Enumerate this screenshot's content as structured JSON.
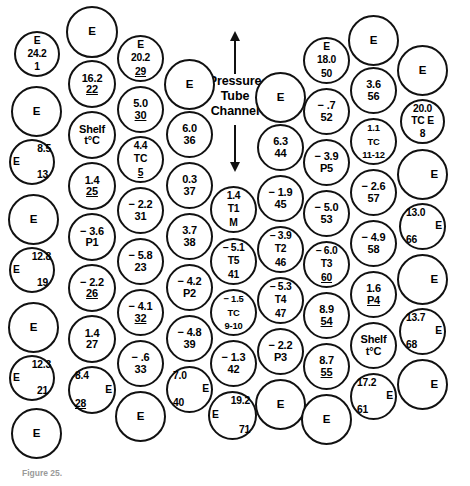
{
  "figure": {
    "center_annotation": [
      "Pressure",
      "Tube",
      "Channel"
    ],
    "caption_label": "Figure 25.",
    "caption_text": "",
    "arrow_up": "arrow-up",
    "arrow_down": "arrow-down"
  },
  "legend_terms": {
    "shelf": "Shelf",
    "shelf_unit": "t°C",
    "empty_marker": "E",
    "thermocouple": "TC"
  },
  "nodes": [
    {
      "id": "c1-r1",
      "col": 1,
      "row": 1,
      "x": 14,
      "y": 31,
      "d": 46,
      "kind": "labeled",
      "lines": [
        {
          "t": "E"
        },
        {
          "t": "24.2"
        },
        {
          "t": "1"
        }
      ],
      "style": "three"
    },
    {
      "id": "c1-r2",
      "col": 1,
      "row": 2,
      "x": 11,
      "y": 86,
      "d": 51,
      "kind": "empty",
      "lines": [
        {
          "t": "E"
        }
      ]
    },
    {
      "id": "c1-r3",
      "col": 1,
      "row": 3,
      "x": 9,
      "y": 139,
      "d": 46,
      "kind": "labeled",
      "lines": [
        {
          "t": "8.5",
          "off": "right"
        },
        {
          "t": "E",
          "off": "left"
        },
        {
          "t": "13",
          "off": "right-in"
        }
      ],
      "style": "three"
    },
    {
      "id": "c1-r4",
      "col": 1,
      "row": 4,
      "x": 8,
      "y": 194,
      "d": 51,
      "kind": "empty",
      "lines": [
        {
          "t": "E"
        }
      ]
    },
    {
      "id": "c1-r5",
      "col": 1,
      "row": 5,
      "x": 9,
      "y": 247,
      "d": 46,
      "kind": "labeled",
      "lines": [
        {
          "t": "12.8",
          "off": "right"
        },
        {
          "t": "E",
          "off": "left"
        },
        {
          "t": "19",
          "off": "right-in"
        }
      ],
      "style": "three"
    },
    {
      "id": "c1-r6",
      "col": 1,
      "row": 6,
      "x": 8,
      "y": 302,
      "d": 51,
      "kind": "empty",
      "lines": [
        {
          "t": "E"
        }
      ]
    },
    {
      "id": "c1-r7",
      "col": 1,
      "row": 7,
      "x": 9,
      "y": 355,
      "d": 46,
      "kind": "labeled",
      "lines": [
        {
          "t": "12.3",
          "off": "right"
        },
        {
          "t": "E",
          "off": "left"
        },
        {
          "t": "21",
          "off": "right-in"
        }
      ],
      "style": "three"
    },
    {
      "id": "c1-r8",
      "col": 1,
      "row": 8,
      "x": 11,
      "y": 408,
      "d": 51,
      "kind": "empty",
      "lines": [
        {
          "t": "E"
        }
      ]
    },
    {
      "id": "c2-r1",
      "col": 2,
      "row": 1,
      "x": 66,
      "y": 6,
      "d": 52,
      "kind": "empty",
      "lines": [
        {
          "t": "E"
        }
      ]
    },
    {
      "id": "c2-r2",
      "col": 2,
      "row": 2,
      "x": 68,
      "y": 60,
      "d": 48,
      "kind": "labeled",
      "lines": [
        {
          "t": "16.2"
        },
        {
          "t": "22",
          "ul": true
        }
      ],
      "style": "labeled"
    },
    {
      "id": "c2-r3",
      "col": 2,
      "row": 3,
      "x": 68,
      "y": 111,
      "d": 48,
      "kind": "labeled",
      "lines": [
        {
          "t": "Shelf"
        },
        {
          "t": "t°C"
        }
      ],
      "style": "labeled"
    },
    {
      "id": "c2-r4",
      "col": 2,
      "row": 4,
      "x": 68,
      "y": 162,
      "d": 48,
      "kind": "labeled",
      "lines": [
        {
          "t": "1.4"
        },
        {
          "t": "25",
          "ul": true
        }
      ],
      "style": "labeled"
    },
    {
      "id": "c2-r5",
      "col": 2,
      "row": 5,
      "x": 68,
      "y": 213,
      "d": 48,
      "kind": "labeled",
      "lines": [
        {
          "t": "− 3.6"
        },
        {
          "t": "P1"
        }
      ],
      "style": "labeled"
    },
    {
      "id": "c2-r6",
      "col": 2,
      "row": 6,
      "x": 68,
      "y": 264,
      "d": 48,
      "kind": "labeled",
      "lines": [
        {
          "t": "− 2.2"
        },
        {
          "t": "26",
          "ul": true
        }
      ],
      "style": "labeled"
    },
    {
      "id": "c2-r7",
      "col": 2,
      "row": 7,
      "x": 68,
      "y": 315,
      "d": 48,
      "kind": "labeled",
      "lines": [
        {
          "t": "1.4"
        },
        {
          "t": "27"
        }
      ],
      "style": "labeled"
    },
    {
      "id": "c2-r8",
      "col": 2,
      "row": 8,
      "x": 68,
      "y": 366,
      "d": 48,
      "kind": "labeled",
      "lines": [
        {
          "t": "8.4",
          "off": "left-in"
        },
        {
          "t": "E",
          "off": "right"
        },
        {
          "t": "28",
          "ul": true,
          "off": "left-in"
        }
      ],
      "style": "three"
    },
    {
      "id": "c3-r1",
      "col": 3,
      "row": 1,
      "x": 117,
      "y": 35,
      "d": 47,
      "kind": "labeled",
      "lines": [
        {
          "t": "E"
        },
        {
          "t": "20.2"
        },
        {
          "t": "29",
          "ul": true
        }
      ],
      "style": "three"
    },
    {
      "id": "c3-r2",
      "col": 3,
      "row": 2,
      "x": 117,
      "y": 86,
      "d": 47,
      "kind": "labeled",
      "lines": [
        {
          "t": "5.0"
        },
        {
          "t": "30",
          "ul": true
        }
      ],
      "style": "labeled"
    },
    {
      "id": "c3-r3",
      "col": 3,
      "row": 3,
      "x": 117,
      "y": 136,
      "d": 47,
      "kind": "labeled",
      "lines": [
        {
          "t": "4.4"
        },
        {
          "t": "TC"
        },
        {
          "t": "5",
          "ul": true
        }
      ],
      "style": "three"
    },
    {
      "id": "c3-r4",
      "col": 3,
      "row": 4,
      "x": 117,
      "y": 187,
      "d": 47,
      "kind": "labeled",
      "lines": [
        {
          "t": "− 2.2"
        },
        {
          "t": "31"
        }
      ],
      "style": "labeled"
    },
    {
      "id": "c3-r5",
      "col": 3,
      "row": 5,
      "x": 117,
      "y": 238,
      "d": 47,
      "kind": "labeled",
      "lines": [
        {
          "t": "− 5.8"
        },
        {
          "t": "23"
        }
      ],
      "style": "labeled"
    },
    {
      "id": "c3-r6",
      "col": 3,
      "row": 6,
      "x": 117,
      "y": 289,
      "d": 47,
      "kind": "labeled",
      "lines": [
        {
          "t": "− 4.1"
        },
        {
          "t": "32",
          "ul": true
        }
      ],
      "style": "labeled"
    },
    {
      "id": "c3-r7",
      "col": 3,
      "row": 7,
      "x": 117,
      "y": 340,
      "d": 47,
      "kind": "labeled",
      "lines": [
        {
          "t": "− .6"
        },
        {
          "t": "33"
        }
      ],
      "style": "labeled"
    },
    {
      "id": "c3-r8",
      "col": 3,
      "row": 8,
      "x": 115,
      "y": 391,
      "d": 51,
      "kind": "empty",
      "lines": [
        {
          "t": "E"
        }
      ]
    },
    {
      "id": "c4-r1",
      "col": 4,
      "row": 1,
      "x": 164,
      "y": 59,
      "d": 51,
      "kind": "empty",
      "lines": [
        {
          "t": "E"
        }
      ]
    },
    {
      "id": "c4-r2",
      "col": 4,
      "row": 2,
      "x": 166,
      "y": 111,
      "d": 47,
      "kind": "labeled",
      "lines": [
        {
          "t": "6.0"
        },
        {
          "t": "36"
        }
      ],
      "style": "labeled"
    },
    {
      "id": "c4-r3",
      "col": 4,
      "row": 3,
      "x": 166,
      "y": 162,
      "d": 47,
      "kind": "labeled",
      "lines": [
        {
          "t": "0.3"
        },
        {
          "t": "37"
        }
      ],
      "style": "labeled"
    },
    {
      "id": "c4-r4",
      "col": 4,
      "row": 4,
      "x": 166,
      "y": 213,
      "d": 47,
      "kind": "labeled",
      "lines": [
        {
          "t": "3.7"
        },
        {
          "t": "38"
        }
      ],
      "style": "labeled"
    },
    {
      "id": "c4-r5",
      "col": 4,
      "row": 5,
      "x": 166,
      "y": 264,
      "d": 47,
      "kind": "labeled",
      "lines": [
        {
          "t": "− 4.2"
        },
        {
          "t": "P2"
        }
      ],
      "style": "labeled"
    },
    {
      "id": "c4-r6",
      "col": 4,
      "row": 6,
      "x": 166,
      "y": 315,
      "d": 47,
      "kind": "labeled",
      "lines": [
        {
          "t": "− 4.8"
        },
        {
          "t": "39"
        }
      ],
      "style": "labeled"
    },
    {
      "id": "c4-r7",
      "col": 4,
      "row": 7,
      "x": 166,
      "y": 366,
      "d": 47,
      "kind": "labeled",
      "lines": [
        {
          "t": "7.0",
          "off": "left-in"
        },
        {
          "t": "E",
          "off": "right"
        },
        {
          "t": "40",
          "off": "left-in"
        }
      ],
      "style": "three"
    },
    {
      "id": "c5-r1",
      "col": 5,
      "row": 1,
      "x": 210,
      "y": 186,
      "d": 47,
      "kind": "labeled",
      "lines": [
        {
          "t": "1.4"
        },
        {
          "t": "T1"
        },
        {
          "t": "M"
        }
      ],
      "style": "three"
    },
    {
      "id": "c5-r2",
      "col": 5,
      "row": 2,
      "x": 210,
      "y": 238,
      "d": 47,
      "kind": "labeled",
      "lines": [
        {
          "t": "− 5.1"
        },
        {
          "t": "T5"
        },
        {
          "t": "41"
        }
      ],
      "style": "three"
    },
    {
      "id": "c5-r3",
      "col": 5,
      "row": 3,
      "x": 210,
      "y": 289,
      "d": 47,
      "kind": "labeled",
      "lines": [
        {
          "t": "− 1.5"
        },
        {
          "t": "TC"
        },
        {
          "t": "9-10"
        }
      ],
      "style": "tiny"
    },
    {
      "id": "c5-r4",
      "col": 5,
      "row": 4,
      "x": 210,
      "y": 340,
      "d": 47,
      "kind": "labeled",
      "lines": [
        {
          "t": "− 1.3"
        },
        {
          "t": "42"
        }
      ],
      "style": "labeled"
    },
    {
      "id": "c5-r5",
      "col": 5,
      "row": 5,
      "x": 208,
      "y": 391,
      "d": 49,
      "kind": "labeled",
      "lines": [
        {
          "t": "19.2",
          "off": "right-in"
        },
        {
          "t": "E",
          "off": "left"
        },
        {
          "t": "71",
          "off": "right-in"
        }
      ],
      "style": "three"
    },
    {
      "id": "c6-r1",
      "col": 6,
      "row": 1,
      "x": 255,
      "y": 72,
      "d": 51,
      "kind": "empty",
      "lines": [
        {
          "t": "E"
        }
      ]
    },
    {
      "id": "c6-r2",
      "col": 6,
      "row": 2,
      "x": 257,
      "y": 124,
      "d": 47,
      "kind": "labeled",
      "lines": [
        {
          "t": "6.3"
        },
        {
          "t": "44"
        }
      ],
      "style": "labeled"
    },
    {
      "id": "c6-r3",
      "col": 6,
      "row": 3,
      "x": 257,
      "y": 175,
      "d": 47,
      "kind": "labeled",
      "lines": [
        {
          "t": "− 1.9"
        },
        {
          "t": "45"
        }
      ],
      "style": "labeled"
    },
    {
      "id": "c6-r4",
      "col": 6,
      "row": 4,
      "x": 257,
      "y": 226,
      "d": 47,
      "kind": "labeled",
      "lines": [
        {
          "t": "− 3.9"
        },
        {
          "t": "T2"
        },
        {
          "t": "46"
        }
      ],
      "style": "three"
    },
    {
      "id": "c6-r5",
      "col": 6,
      "row": 5,
      "x": 257,
      "y": 277,
      "d": 47,
      "kind": "labeled",
      "lines": [
        {
          "t": "− 5.3"
        },
        {
          "t": "T4"
        },
        {
          "t": "47"
        }
      ],
      "style": "three"
    },
    {
      "id": "c6-r6",
      "col": 6,
      "row": 6,
      "x": 257,
      "y": 328,
      "d": 47,
      "kind": "labeled",
      "lines": [
        {
          "t": "− 2.2"
        },
        {
          "t": "P3"
        }
      ],
      "style": "labeled"
    },
    {
      "id": "c6-r7",
      "col": 6,
      "row": 7,
      "x": 255,
      "y": 379,
      "d": 51,
      "kind": "empty",
      "lines": [
        {
          "t": "E"
        }
      ]
    },
    {
      "id": "c7-r1",
      "col": 7,
      "row": 1,
      "x": 303,
      "y": 37,
      "d": 47,
      "kind": "labeled",
      "lines": [
        {
          "t": "E"
        },
        {
          "t": "18.0"
        },
        {
          "t": "50"
        }
      ],
      "style": "three"
    },
    {
      "id": "c7-r2",
      "col": 7,
      "row": 2,
      "x": 303,
      "y": 88,
      "d": 47,
      "kind": "labeled",
      "lines": [
        {
          "t": "− .7"
        },
        {
          "t": "52"
        }
      ],
      "style": "labeled"
    },
    {
      "id": "c7-r3",
      "col": 7,
      "row": 3,
      "x": 303,
      "y": 139,
      "d": 47,
      "kind": "labeled",
      "lines": [
        {
          "t": "− 3.9"
        },
        {
          "t": "P5"
        }
      ],
      "style": "labeled"
    },
    {
      "id": "c7-r4",
      "col": 7,
      "row": 4,
      "x": 303,
      "y": 190,
      "d": 47,
      "kind": "labeled",
      "lines": [
        {
          "t": "− 5.0"
        },
        {
          "t": "53"
        }
      ],
      "style": "labeled"
    },
    {
      "id": "c7-r5",
      "col": 7,
      "row": 5,
      "x": 303,
      "y": 241,
      "d": 47,
      "kind": "labeled",
      "lines": [
        {
          "t": "− 6.0"
        },
        {
          "t": "T3"
        },
        {
          "t": "60",
          "ul": true
        }
      ],
      "style": "three"
    },
    {
      "id": "c7-r6",
      "col": 7,
      "row": 6,
      "x": 303,
      "y": 292,
      "d": 47,
      "kind": "labeled",
      "lines": [
        {
          "t": "8.9"
        },
        {
          "t": "54",
          "ul": true
        }
      ],
      "style": "labeled"
    },
    {
      "id": "c7-r7",
      "col": 7,
      "row": 7,
      "x": 303,
      "y": 343,
      "d": 47,
      "kind": "labeled",
      "lines": [
        {
          "t": "8.7"
        },
        {
          "t": "55",
          "ul": true
        }
      ],
      "style": "labeled"
    },
    {
      "id": "c7-r8",
      "col": 7,
      "row": 8,
      "x": 301,
      "y": 394,
      "d": 51,
      "kind": "empty",
      "lines": [
        {
          "t": "E"
        }
      ]
    },
    {
      "id": "c8-r1",
      "col": 8,
      "row": 1,
      "x": 348,
      "y": 15,
      "d": 51,
      "kind": "empty",
      "lines": [
        {
          "t": "E"
        }
      ]
    },
    {
      "id": "c8-r2",
      "col": 8,
      "row": 2,
      "x": 350,
      "y": 67,
      "d": 47,
      "kind": "labeled",
      "lines": [
        {
          "t": "3.6"
        },
        {
          "t": "56"
        }
      ],
      "style": "labeled"
    },
    {
      "id": "c8-r3",
      "col": 8,
      "row": 3,
      "x": 350,
      "y": 118,
      "d": 47,
      "kind": "labeled",
      "lines": [
        {
          "t": "1.1"
        },
        {
          "t": "TC"
        },
        {
          "t": "11-12"
        }
      ],
      "style": "tiny"
    },
    {
      "id": "c8-r4",
      "col": 8,
      "row": 4,
      "x": 350,
      "y": 169,
      "d": 47,
      "kind": "labeled",
      "lines": [
        {
          "t": "− 2.6"
        },
        {
          "t": "57"
        }
      ],
      "style": "labeled"
    },
    {
      "id": "c8-r5",
      "col": 8,
      "row": 5,
      "x": 350,
      "y": 220,
      "d": 47,
      "kind": "labeled",
      "lines": [
        {
          "t": "− 4.9"
        },
        {
          "t": "58"
        }
      ],
      "style": "labeled"
    },
    {
      "id": "c8-r6",
      "col": 8,
      "row": 6,
      "x": 350,
      "y": 271,
      "d": 47,
      "kind": "labeled",
      "lines": [
        {
          "t": "1.6"
        },
        {
          "t": "P4",
          "ul": true
        }
      ],
      "style": "labeled"
    },
    {
      "id": "c8-r7",
      "col": 8,
      "row": 7,
      "x": 350,
      "y": 322,
      "d": 47,
      "kind": "labeled",
      "lines": [
        {
          "t": "Shelf"
        },
        {
          "t": "t°C"
        }
      ],
      "style": "labeled"
    },
    {
      "id": "c8-r8",
      "col": 8,
      "row": 8,
      "x": 350,
      "y": 373,
      "d": 47,
      "kind": "labeled",
      "lines": [
        {
          "t": "17.2",
          "off": "left-in"
        },
        {
          "t": "E",
          "off": "right"
        },
        {
          "t": "61",
          "off": "left-in"
        }
      ],
      "style": "three"
    },
    {
      "id": "c9-r1",
      "col": 9,
      "row": 1,
      "x": 397,
      "y": 45,
      "d": 51,
      "kind": "empty",
      "lines": [
        {
          "t": "E"
        }
      ]
    },
    {
      "id": "c9-r2",
      "col": 9,
      "row": 2,
      "x": 400,
      "y": 99,
      "d": 45,
      "kind": "labeled",
      "lines": [
        {
          "t": "20.0"
        },
        {
          "t": "TC E"
        },
        {
          "t": "8"
        }
      ],
      "style": "three"
    },
    {
      "id": "c9-r3",
      "col": 9,
      "row": 3,
      "x": 397,
      "y": 149,
      "d": 51,
      "kind": "empty",
      "lines": [
        {
          "t": "E"
        }
      ],
      "align": "right"
    },
    {
      "id": "c9-r4",
      "col": 9,
      "row": 4,
      "x": 399,
      "y": 203,
      "d": 47,
      "kind": "labeled",
      "lines": [
        {
          "t": "13.0",
          "off": "left-in"
        },
        {
          "t": "E",
          "off": "right"
        },
        {
          "t": "66",
          "off": "left-in"
        }
      ],
      "style": "three"
    },
    {
      "id": "c9-r5",
      "col": 9,
      "row": 5,
      "x": 397,
      "y": 254,
      "d": 51,
      "kind": "empty",
      "lines": [
        {
          "t": "E"
        }
      ],
      "align": "right"
    },
    {
      "id": "c9-r6",
      "col": 9,
      "row": 6,
      "x": 399,
      "y": 308,
      "d": 47,
      "kind": "labeled",
      "lines": [
        {
          "t": "13.7",
          "off": "left-in"
        },
        {
          "t": "E",
          "off": "right"
        },
        {
          "t": "68",
          "off": "left-in"
        }
      ],
      "style": "three"
    },
    {
      "id": "c9-r7",
      "col": 9,
      "row": 7,
      "x": 397,
      "y": 359,
      "d": 51,
      "kind": "empty",
      "lines": [
        {
          "t": "E"
        }
      ],
      "align": "right"
    }
  ]
}
